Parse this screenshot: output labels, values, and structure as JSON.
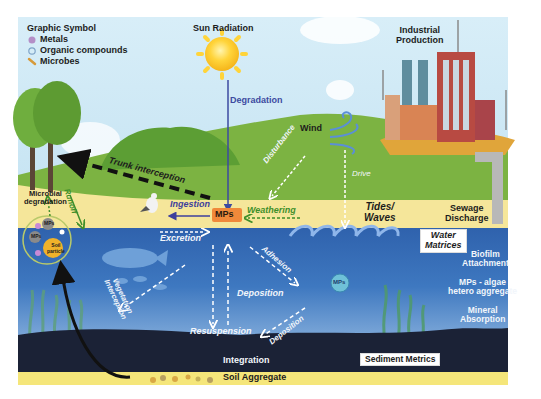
{
  "legend": {
    "title": "Graphic Symbol",
    "items": [
      {
        "label": "Metals",
        "icon": "metal-circle-icon",
        "color": "#b48fc7"
      },
      {
        "label": "Organic compounds",
        "icon": "organic-compound-icon",
        "color": "#7fa4c8"
      },
      {
        "label": "Microbes",
        "icon": "microbe-rod-icon",
        "color": "#d69a3a"
      }
    ]
  },
  "sources": {
    "sun": "Sun Radiation",
    "industry_line1": "Industrial",
    "industry_line2": "Production",
    "wind": "Wind",
    "sewage_line1": "Sewage",
    "sewage_line2": "Discharge",
    "tides_line1": "Tides/",
    "tides_line2": "Waves"
  },
  "center": {
    "mps": "MPs"
  },
  "processes": {
    "degradation": "Degradation",
    "ingestion": "Ingestion",
    "weathering": "Weathering",
    "disturbance": "Disturbance",
    "drive": "Drive",
    "trunk_interception": "Trunk interception",
    "runoff": "Runoff",
    "microbial_line1": "Microbial",
    "microbial_line2": "degradation",
    "excretion": "Excretion",
    "adhesion": "Adhesion",
    "deposition_center": "Deposition",
    "deposition_right": "Deposition",
    "resuspension": "Resuspension",
    "vegetation_line1": "Vegetation",
    "vegetation_line2": "Interception",
    "integration": "Integration"
  },
  "soil_circle": {
    "mps_a": "MPs",
    "mps_b": "MPs",
    "soil_line1": "Soil",
    "soil_line2": "particle"
  },
  "water_mps_bubble": "MPs",
  "matrices": {
    "water_line1": "Water",
    "water_line2": "Matrices",
    "water_processes": [
      {
        "line1": "Biofilm",
        "line2": "Attachment"
      },
      {
        "line1": "MPs - algae",
        "line2": "hetero aggregate"
      },
      {
        "line1": "Mineral",
        "line2": "Absorption"
      }
    ],
    "sediment": "Sediment Metrics",
    "soil_aggregate": "Soil Aggregate"
  },
  "colors": {
    "sky": "#cfe8f4",
    "hill": "#7cb342",
    "sand": "#f5e69a",
    "water_top": "#3a6fb8",
    "water_bottom": "#7fa9da",
    "sediment": "#1b2236",
    "mps_box": "#f0893a",
    "degradation_text": "#3d4aa0",
    "weathering_text": "#3f8f2a",
    "ingestion_arrow": "#3d3f9c"
  }
}
